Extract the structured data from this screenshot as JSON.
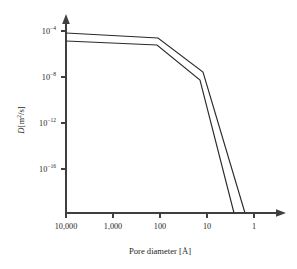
{
  "chart_data": {
    "type": "line",
    "title": "",
    "xlabel": "Pore diameter [Å]",
    "ylabel": "D[m2/s]",
    "ylabel_parts": {
      "symbol": "D",
      "open": "[m",
      "exponent": "2",
      "close": "/s]"
    },
    "x_scale": "log-reversed",
    "y_scale": "log",
    "xlim": [
      10000,
      1
    ],
    "ylim": [
      1e-18,
      0.001
    ],
    "grid": false,
    "legend": null,
    "x_ticks": [
      {
        "value": 10000,
        "label": "10,000"
      },
      {
        "value": 1000,
        "label": "1,000"
      },
      {
        "value": 100,
        "label": "100"
      },
      {
        "value": 10,
        "label": "10"
      },
      {
        "value": 1,
        "label": "1"
      }
    ],
    "y_ticks": [
      {
        "value": 0.0001,
        "mantissa": "10",
        "exponent": "−4",
        "label": "10⁻⁴"
      },
      {
        "value": 1e-08,
        "mantissa": "10",
        "exponent": "−8",
        "label": "10⁻⁸"
      },
      {
        "value": 1e-12,
        "mantissa": "10",
        "exponent": "−12",
        "label": "10⁻¹²"
      },
      {
        "value": 1e-16,
        "mantissa": "10",
        "exponent": "−16",
        "label": "10⁻¹⁶"
      }
    ],
    "series": [
      {
        "name": "upper-curve",
        "x": [
          10000,
          150,
          9,
          2.6
        ],
        "y": [
          4.2e-05,
          3e-05,
          7e-09,
          1e-18
        ],
        "points_px": "66,33 158,38 203,72 245,213"
      },
      {
        "name": "lower-curve",
        "x": [
          10000,
          150,
          9.5,
          3.4
        ],
        "y": [
          1.3e-05,
          9e-06,
          1.1e-09,
          1e-18
        ],
        "points_px": "66,41 157,45 200,80 234,213"
      }
    ],
    "colors": {
      "line": "#2b2b2d",
      "axis": "#3f3f41",
      "text": "#231f20",
      "background": "#ffffff"
    }
  },
  "geometry": {
    "axis_x_px": 66,
    "axis_y_px": 213,
    "x_tick_px": [
      66,
      113,
      160,
      207,
      254
    ],
    "y_tick_px": [
      31,
      77,
      123,
      169
    ]
  }
}
